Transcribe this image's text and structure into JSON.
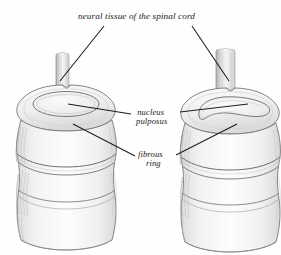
{
  "figure": {
    "title": "neural tissue of the spinal cord",
    "background_color": "#fefefe",
    "ink_color": "#1c1c1c",
    "shading_color": "#b9b9b9",
    "width": 281,
    "height": 255
  },
  "labels": {
    "spinal_cord": "neural tissue of the spinal cord",
    "nucleus_line1": "nucleus",
    "nucleus_line2": "pulposus",
    "fibrous_line1": "fibrous",
    "fibrous_line2": "ring"
  },
  "specimens": [
    {
      "name": "left-vertebra",
      "description": "intact intervertebral disc viewed from above with central nucleus pulposus",
      "position": "left"
    },
    {
      "name": "right-vertebra",
      "description": "compressed intervertebral disc with displaced nucleus pulposus",
      "position": "right"
    }
  ],
  "leader_lines": [
    {
      "name": "title-to-left-cord",
      "from": "title",
      "to": "left-spinal-cord"
    },
    {
      "name": "title-to-right-cord",
      "from": "title",
      "to": "right-spinal-cord"
    },
    {
      "name": "nucleus-to-left",
      "from": "nucleus-label",
      "to": "left-nucleus"
    },
    {
      "name": "nucleus-to-right",
      "from": "nucleus-label",
      "to": "right-nucleus"
    },
    {
      "name": "fibrous-to-left",
      "from": "fibrous-label",
      "to": "left-annulus"
    },
    {
      "name": "fibrous-to-right",
      "from": "fibrous-label",
      "to": "right-annulus"
    }
  ]
}
